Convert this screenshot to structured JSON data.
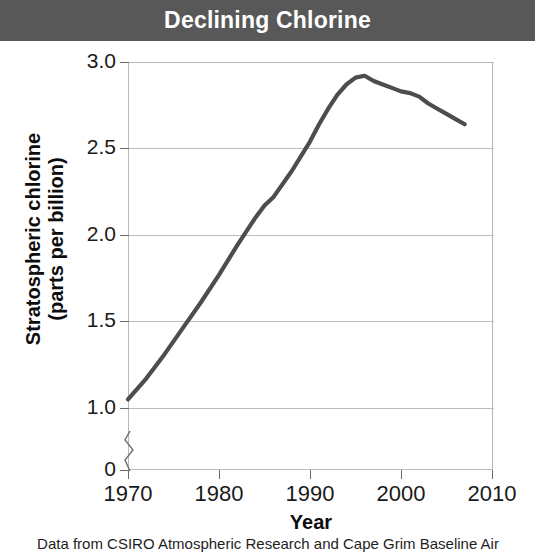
{
  "title": "Declining Chlorine",
  "caption": "Data from CSIRO Atmospheric Research and Cape Grim Baseline Air",
  "colors": {
    "banner_bg": "#585858",
    "banner_text": "#ffffff",
    "line": "#4d4d4d",
    "grid": "#bdbdbd",
    "axis": "#6d6d6d",
    "text": "#1a1a1a"
  },
  "chart_data": {
    "type": "line",
    "title": "Declining Chlorine",
    "xlabel": "Year",
    "ylabel": "Stratospheric chlorine (parts per billion)",
    "ylabel_line1": "Stratospheric chlorine",
    "ylabel_line2": "(parts per billion)",
    "xlim": [
      1970,
      2010
    ],
    "ylim": [
      0,
      3.0
    ],
    "y_axis_break": true,
    "y_break_between": [
      0,
      1.0
    ],
    "grid": "horizontal",
    "legend": "none",
    "xticks": [
      1970,
      1980,
      1990,
      2000,
      2010
    ],
    "xticklabels": [
      "1970",
      "1980",
      "1990",
      "2000",
      "2010"
    ],
    "yticks": [
      0,
      1.0,
      1.5,
      2.0,
      2.5,
      3.0
    ],
    "yticklabels": [
      "0",
      "1.0",
      "1.5",
      "2.0",
      "2.5",
      "3.0"
    ],
    "series": [
      {
        "name": "Stratospheric chlorine",
        "x": [
          1970,
          1972,
          1974,
          1976,
          1978,
          1980,
          1982,
          1984,
          1985,
          1986,
          1988,
          1990,
          1991,
          1992,
          1993,
          1994,
          1995,
          1996,
          1997,
          1998,
          1999,
          2000,
          2001,
          2002,
          2003,
          2004,
          2005,
          2006,
          2007
        ],
        "values": [
          1.05,
          1.17,
          1.31,
          1.46,
          1.61,
          1.77,
          1.94,
          2.1,
          2.17,
          2.22,
          2.37,
          2.54,
          2.64,
          2.73,
          2.81,
          2.87,
          2.91,
          2.92,
          2.89,
          2.87,
          2.85,
          2.83,
          2.82,
          2.8,
          2.76,
          2.73,
          2.7,
          2.67,
          2.64
        ]
      }
    ]
  },
  "axis_titles": {
    "x": "Year",
    "y_line1": "Stratospheric chlorine",
    "y_line2": "(parts per billion)"
  }
}
